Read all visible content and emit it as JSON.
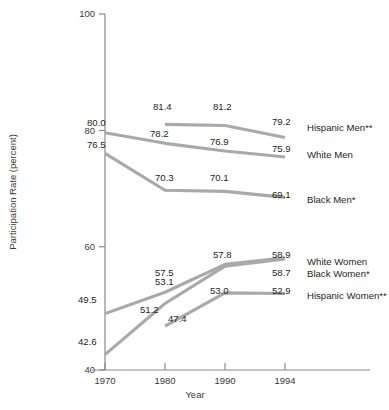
{
  "chart_data": {
    "type": "line",
    "title": "",
    "xlabel": "Year",
    "ylabel": "Participation Rate (percent)",
    "x": [
      1970,
      1980,
      1990,
      1994
    ],
    "xticklabels": [
      "1970",
      "1980",
      "1990",
      "1994"
    ],
    "yticklabels": [
      "40",
      "60",
      "80",
      "100"
    ],
    "yticks": [
      40,
      60,
      80,
      100
    ],
    "ylim": [
      40,
      100
    ],
    "xlim": [
      1966,
      1996
    ],
    "grid": false,
    "legend_position": "right-inline",
    "line_color": "#a9a9a9",
    "series": [
      {
        "name": "Hispanic Men**",
        "label": "Hispanic Men**",
        "x": [
          1980,
          1990,
          1994
        ],
        "values": [
          81.4,
          81.2,
          79.2
        ],
        "point_labels": [
          "81.4",
          "81.2",
          "79.2"
        ]
      },
      {
        "name": "White Men",
        "label": "White Men",
        "x": [
          1970,
          1980,
          1990,
          1994
        ],
        "values": [
          80.0,
          78.2,
          76.9,
          75.9
        ],
        "point_labels": [
          "80.0",
          "78.2",
          "76.9",
          "75.9"
        ]
      },
      {
        "name": "Black Men*",
        "label": "Black Men*",
        "x": [
          1970,
          1980,
          1990,
          1994
        ],
        "values": [
          76.5,
          70.3,
          70.1,
          69.1
        ],
        "point_labels": [
          "76.5",
          "70.3",
          "70.1",
          "69.1"
        ]
      },
      {
        "name": "White Women",
        "label": "White Women",
        "x": [
          1970,
          1980,
          1990,
          1994
        ],
        "values": [
          49.5,
          53.1,
          57.8,
          58.9
        ],
        "point_labels": [
          "49.5",
          "53.1",
          "57.8",
          "58.9"
        ]
      },
      {
        "name": "Black Women*",
        "label": "Black Women*",
        "x": [
          1970,
          1980,
          1990,
          1994
        ],
        "values": [
          42.6,
          51.2,
          57.5,
          58.7
        ],
        "point_labels": [
          "42.6",
          "51.2",
          "57.5",
          "58.7"
        ]
      },
      {
        "name": "Hispanic Women**",
        "label": "Hispanic Women**",
        "x": [
          1980,
          1990,
          1994
        ],
        "values": [
          47.4,
          53.0,
          52.9
        ],
        "point_labels": [
          "47.4",
          "53.0",
          "52.9"
        ]
      }
    ]
  },
  "layout": {
    "plot_left": 105,
    "plot_right": 285,
    "plot_top": 14,
    "plot_bottom": 370,
    "year_x": {
      "1970": 105,
      "1980": 165,
      "1990": 225,
      "1994": 285
    },
    "value_y": {
      "40": 370,
      "60": 246.7,
      "80": 130.5,
      "100": 14
    },
    "series_label_x": 307,
    "series_label_y": {
      "Hispanic Men**": 131,
      "White Men": 158,
      "Black Men*": 203,
      "White Women": 265,
      "Black Women*": 277,
      "Hispanic Women**": 299
    },
    "point_label_offsets": [
      {
        "series": "Hispanic Men**",
        "idx": 0,
        "x": 153,
        "y": 110
      },
      {
        "series": "Hispanic Men**",
        "idx": 1,
        "x": 213,
        "y": 110
      },
      {
        "series": "Hispanic Men**",
        "idx": 2,
        "x": 272,
        "y": 125
      },
      {
        "series": "White Men",
        "idx": 0,
        "x": 87,
        "y": 126
      },
      {
        "series": "White Men",
        "idx": 1,
        "x": 150,
        "y": 137
      },
      {
        "series": "White Men",
        "idx": 2,
        "x": 210,
        "y": 145
      },
      {
        "series": "White Men",
        "idx": 3,
        "x": 272,
        "y": 152
      },
      {
        "series": "Black Men*",
        "idx": 0,
        "x": 87,
        "y": 148
      },
      {
        "series": "Black Men*",
        "idx": 1,
        "x": 155,
        "y": 181
      },
      {
        "series": "Black Men*",
        "idx": 2,
        "x": 210,
        "y": 181
      },
      {
        "series": "Black Men*",
        "idx": 3,
        "x": 272,
        "y": 198
      },
      {
        "series": "White Women",
        "idx": 0,
        "x": 78,
        "y": 303
      },
      {
        "series": "White Women",
        "idx": 1,
        "x": 155,
        "y": 285
      },
      {
        "series": "White Women",
        "idx": 2,
        "x": 213,
        "y": 258
      },
      {
        "series": "White Women",
        "idx": 3,
        "x": 272,
        "y": 258
      },
      {
        "series": "Black Women*",
        "idx": 0,
        "x": 78,
        "y": 345
      },
      {
        "series": "Black Women*",
        "idx": 1,
        "x": 140,
        "y": 313
      },
      {
        "series": "Black Women*",
        "idx": 2,
        "x": 155,
        "y": 276
      },
      {
        "series": "Black Women*",
        "idx": 3,
        "x": 272,
        "y": 276
      },
      {
        "series": "Hispanic Women**",
        "idx": 0,
        "x": 168,
        "y": 322
      },
      {
        "series": "Hispanic Women**",
        "idx": 1,
        "x": 210,
        "y": 294
      },
      {
        "series": "Hispanic Women**",
        "idx": 2,
        "x": 272,
        "y": 294
      }
    ]
  }
}
